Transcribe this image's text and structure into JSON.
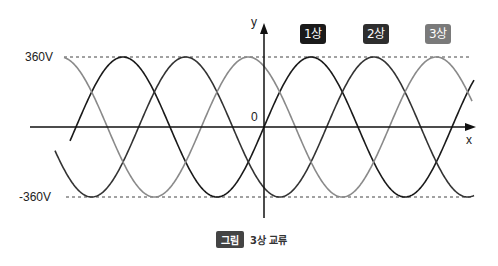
{
  "chart_data": {
    "type": "line",
    "title": "3상 교류",
    "xlabel": "x",
    "ylabel": "y",
    "origin_label": "0",
    "ylim": [
      -360,
      360
    ],
    "y_tick_labels": [
      "360V",
      "-360V"
    ],
    "amplitude": 360,
    "grid": false,
    "legend": "top-right",
    "series": [
      {
        "name": "1상",
        "phase_deg": 0,
        "color": "#1a1a1a"
      },
      {
        "name": "2상",
        "phase_deg": -120,
        "color": "#333333"
      },
      {
        "name": "3상",
        "phase_deg": -240,
        "color": "#8a8a8a"
      }
    ]
  },
  "caption": {
    "tag": "그림",
    "text": "3상 교류"
  }
}
